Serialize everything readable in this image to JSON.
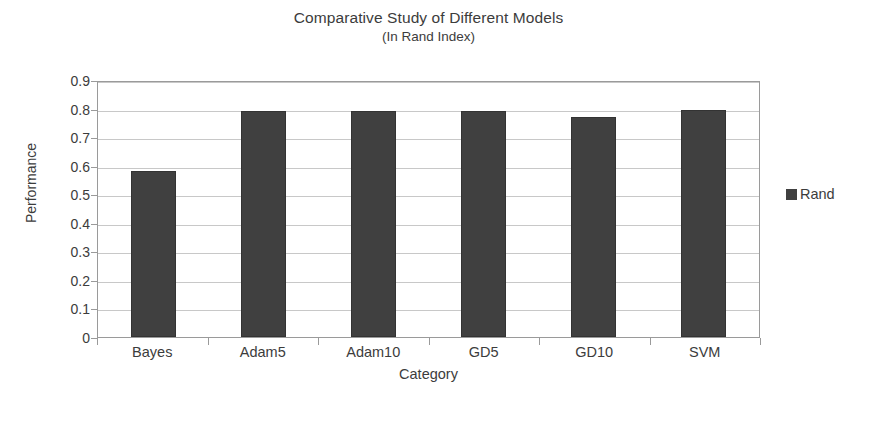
{
  "chart_data": {
    "type": "bar",
    "title": "Comparative Study of Different Models",
    "subtitle": "(In Rand Index)",
    "xlabel": "Category",
    "ylabel": "Performance",
    "categories": [
      "Bayes",
      "Adam5",
      "Adam10",
      "GD5",
      "GD10",
      "SVM"
    ],
    "series": [
      {
        "name": "Rand",
        "color": "#404040",
        "values": [
          0.58,
          0.79,
          0.79,
          0.79,
          0.77,
          0.795
        ]
      }
    ],
    "ylim": [
      0,
      0.9
    ],
    "ytick_labels": [
      "0.9",
      "0.8",
      "0.7",
      "0.6",
      "0.5",
      "0.4",
      "0.3",
      "0.2",
      "0.1",
      "0"
    ],
    "ytick_values": [
      0.9,
      0.8,
      0.7,
      0.6,
      0.5,
      0.4,
      0.3,
      0.2,
      0.1,
      0
    ],
    "grid": true,
    "legend_position": "right"
  },
  "legend": {
    "entries": [
      {
        "label": "Rand",
        "color": "#404040"
      }
    ]
  },
  "colors": {
    "bar": "#404040",
    "gridline": "#c8c8c8",
    "axis": "#9a9a9a",
    "text": "#3c3c3c",
    "background": "#ffffff"
  }
}
